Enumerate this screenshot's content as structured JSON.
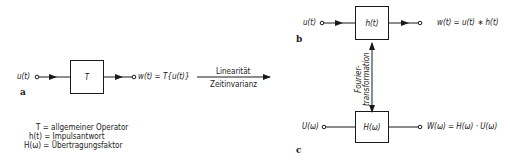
{
  "diagram_a": {
    "tag": "a",
    "input": "u(t)",
    "block": "T",
    "output": "w(t) = T{u(t)}"
  },
  "legend": [
    "T = allgemeiner Operator",
    "h(t) = Impulsantwort",
    "H(ω) = Übertragungsfaktor"
  ],
  "transition": {
    "top": "Linearität",
    "bottom": "Zeitinvarianz"
  },
  "diagram_b": {
    "tag": "b",
    "input": "u(t)",
    "block": "h(t)",
    "output": "w(t) = u(t) ∗ h(t)"
  },
  "fourier": {
    "line1": "Fourier-",
    "line2": "transformation"
  },
  "diagram_c": {
    "tag": "c",
    "input": "U(ω)",
    "block": "H(ω)",
    "output": "W(ω) = H(ω) · U(ω)"
  }
}
